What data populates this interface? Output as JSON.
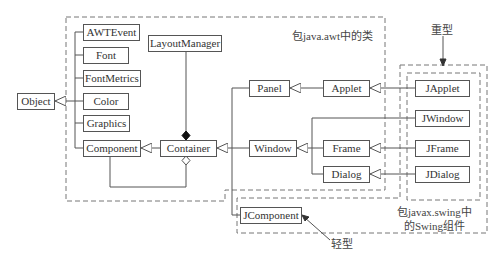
{
  "diagram": {
    "type": "class-hierarchy",
    "groups": {
      "awt": {
        "label": "包java.awt中的类"
      },
      "swing": {
        "label_line1": "包javax.swing中",
        "label_line2": "的Swing组件"
      },
      "heavyweight": {
        "label": "重型"
      },
      "lightweight": {
        "label": "轻型"
      }
    },
    "classes": {
      "object": "Object",
      "awtevent": "AWTEvent",
      "font": "Font",
      "fontmetrics": "FontMetrics",
      "color": "Color",
      "graphics": "Graphics",
      "component": "Component",
      "layoutmanager": "LayoutManager",
      "container": "Container",
      "panel": "Panel",
      "applet": "Applet",
      "window": "Window",
      "frame": "Frame",
      "dialog": "Dialog",
      "japplet": "JApplet",
      "jwindow": "JWindow",
      "jframe": "JFrame",
      "jdialog": "JDialog",
      "jcomponent": "JComponent"
    },
    "relations": [
      {
        "from": "AWTEvent",
        "to": "Object",
        "type": "inheritance"
      },
      {
        "from": "Font",
        "to": "Object",
        "type": "inheritance"
      },
      {
        "from": "FontMetrics",
        "to": "Object",
        "type": "inheritance"
      },
      {
        "from": "Color",
        "to": "Object",
        "type": "inheritance"
      },
      {
        "from": "Graphics",
        "to": "Object",
        "type": "inheritance"
      },
      {
        "from": "Component",
        "to": "Object",
        "type": "inheritance"
      },
      {
        "from": "Container",
        "to": "Component",
        "type": "inheritance"
      },
      {
        "from": "Container",
        "to": "LayoutManager",
        "type": "composition"
      },
      {
        "from": "Container",
        "to": "Component",
        "type": "aggregation"
      },
      {
        "from": "Panel",
        "to": "Container",
        "type": "inheritance"
      },
      {
        "from": "Window",
        "to": "Container",
        "type": "inheritance"
      },
      {
        "from": "JComponent",
        "to": "Container",
        "type": "inheritance"
      },
      {
        "from": "Applet",
        "to": "Panel",
        "type": "inheritance"
      },
      {
        "from": "Frame",
        "to": "Window",
        "type": "inheritance"
      },
      {
        "from": "Dialog",
        "to": "Window",
        "type": "inheritance"
      },
      {
        "from": "JWindow",
        "to": "Window",
        "type": "inheritance"
      },
      {
        "from": "JApplet",
        "to": "Applet",
        "type": "inheritance"
      },
      {
        "from": "JFrame",
        "to": "Frame",
        "type": "inheritance"
      },
      {
        "from": "JDialog",
        "to": "Dialog",
        "type": "inheritance"
      }
    ]
  }
}
